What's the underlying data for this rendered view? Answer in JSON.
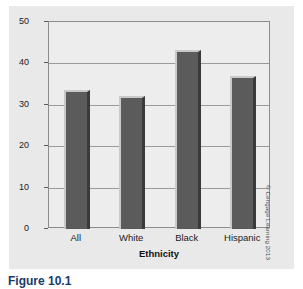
{
  "figure": {
    "caption": "Figure 10.1",
    "copyright": "© Cengage Learning 2013"
  },
  "chart_data": {
    "type": "bar",
    "title": "",
    "categories": [
      "All",
      "White",
      "Black",
      "Hispanic"
    ],
    "values": [
      33.6,
      32.1,
      43.2,
      37.0
    ],
    "xlabel": "Ethnicity",
    "ylabel": "Percentage with BMI >30",
    "ylim": [
      0,
      50
    ],
    "yticks": [
      0,
      10,
      20,
      30,
      40,
      50
    ],
    "ytick_labels": [
      "0",
      "10",
      "20",
      "30",
      "40",
      "50"
    ],
    "grid": true,
    "legend": false,
    "bar_color": "#5b5b5b",
    "plot_background": "#ededed",
    "figure_background": "#e9e9e9"
  }
}
